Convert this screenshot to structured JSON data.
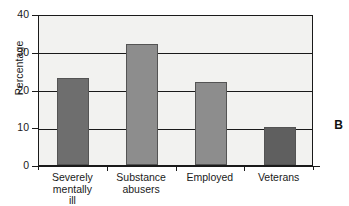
{
  "panel": {
    "letter": "B"
  },
  "chart_data": {
    "type": "bar",
    "title": "",
    "xlabel": "",
    "ylabel": "Percentage",
    "categories": [
      "Severely\nmentally\nill",
      "Substance\nabusers",
      "Employed",
      "Veterans"
    ],
    "values": [
      23,
      32,
      22,
      10
    ],
    "ylim": [
      0,
      40
    ],
    "yticks": [
      0,
      10,
      20,
      30,
      40
    ],
    "ytick_labels": [
      "0",
      "10",
      "20",
      "30",
      "40"
    ],
    "grid": "horizontal",
    "legend": "none",
    "bar_colors": [
      "#6e6e6e",
      "#8d8d8d",
      "#8d8d8d",
      "#5f5f5f"
    ],
    "plot_background": "#f2f2f0",
    "axis_color": "#1a1a1a"
  }
}
